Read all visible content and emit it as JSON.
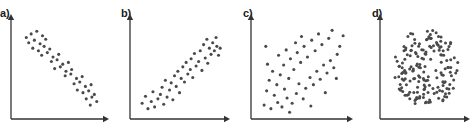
{
  "figure": {
    "background_color": "#ffffff",
    "dot_color": "#4a4a4a",
    "axis_color": "#333333",
    "label_color": "#1a1a1a",
    "width": 471,
    "height": 137
  },
  "panels": [
    {
      "label": "a)",
      "label_x": 0,
      "label_y": 8,
      "origin_x": 11,
      "origin_y": 6,
      "axis_x_start": 11,
      "axis_x_end": 109,
      "axis_y_bottom": 119,
      "axis_y_top": 19,
      "description": "strong negative correlation"
    },
    {
      "label": "b)",
      "label_x": 121,
      "label_y": 8,
      "origin_x": 130,
      "origin_y": 6,
      "axis_x_start": 130,
      "axis_x_end": 230,
      "axis_y_bottom": 119,
      "axis_y_top": 19,
      "description": "strong positive correlation"
    },
    {
      "label": "c)",
      "label_x": 243,
      "label_y": 8,
      "origin_x": 251,
      "origin_y": 6,
      "axis_x_start": 251,
      "axis_x_end": 353,
      "axis_y_bottom": 119,
      "axis_y_top": 19,
      "description": "weak positive correlation"
    },
    {
      "label": "d)",
      "label_x": 372,
      "label_y": 8,
      "origin_x": 380,
      "origin_y": 6,
      "axis_x_start": 380,
      "axis_x_end": 470,
      "axis_y_bottom": 119,
      "axis_y_top": 19,
      "description": "no correlation, circular cloud"
    }
  ],
  "chart_data": [
    {
      "type": "scatter",
      "title": "a)",
      "xlabel": "",
      "ylabel": "",
      "xlim": [
        0,
        100
      ],
      "ylim": [
        0,
        100
      ],
      "grid": false,
      "legend": "none",
      "annotation": "strong negative correlation",
      "points": [
        [
          9,
          86
        ],
        [
          15,
          90
        ],
        [
          22,
          93
        ],
        [
          29,
          88
        ],
        [
          12,
          80
        ],
        [
          19,
          83
        ],
        [
          26,
          79
        ],
        [
          33,
          84
        ],
        [
          17,
          74
        ],
        [
          24,
          71
        ],
        [
          31,
          76
        ],
        [
          38,
          73
        ],
        [
          28,
          66
        ],
        [
          35,
          69
        ],
        [
          42,
          64
        ],
        [
          49,
          67
        ],
        [
          40,
          59
        ],
        [
          47,
          61
        ],
        [
          54,
          56
        ],
        [
          61,
          58
        ],
        [
          44,
          51
        ],
        [
          51,
          53
        ],
        [
          58,
          48
        ],
        [
          65,
          50
        ],
        [
          57,
          43
        ],
        [
          64,
          45
        ],
        [
          71,
          40
        ],
        [
          78,
          42
        ],
        [
          68,
          34
        ],
        [
          75,
          36
        ],
        [
          82,
          31
        ],
        [
          89,
          33
        ],
        [
          72,
          27
        ],
        [
          79,
          24
        ],
        [
          86,
          26
        ],
        [
          93,
          22
        ],
        [
          83,
          17
        ],
        [
          90,
          19
        ],
        [
          96,
          14
        ],
        [
          88,
          10
        ]
      ]
    },
    {
      "type": "scatter",
      "title": "b)",
      "xlabel": "",
      "ylabel": "",
      "xlim": [
        0,
        100
      ],
      "ylim": [
        0,
        100
      ],
      "grid": false,
      "legend": "none",
      "annotation": "strong positive correlation",
      "points": [
        [
          5,
          12
        ],
        [
          12,
          6
        ],
        [
          9,
          20
        ],
        [
          16,
          14
        ],
        [
          20,
          8
        ],
        [
          24,
          17
        ],
        [
          18,
          25
        ],
        [
          27,
          22
        ],
        [
          31,
          11
        ],
        [
          35,
          19
        ],
        [
          29,
          30
        ],
        [
          38,
          27
        ],
        [
          42,
          16
        ],
        [
          33,
          38
        ],
        [
          40,
          35
        ],
        [
          46,
          31
        ],
        [
          50,
          24
        ],
        [
          44,
          43
        ],
        [
          52,
          40
        ],
        [
          48,
          48
        ],
        [
          56,
          36
        ],
        [
          60,
          45
        ],
        [
          54,
          53
        ],
        [
          63,
          50
        ],
        [
          58,
          58
        ],
        [
          66,
          41
        ],
        [
          70,
          54
        ],
        [
          64,
          62
        ],
        [
          73,
          59
        ],
        [
          68,
          68
        ],
        [
          77,
          49
        ],
        [
          81,
          63
        ],
        [
          75,
          71
        ],
        [
          84,
          57
        ],
        [
          88,
          67
        ],
        [
          79,
          78
        ],
        [
          86,
          74
        ],
        [
          92,
          71
        ],
        [
          90,
          80
        ],
        [
          95,
          76
        ],
        [
          83,
          84
        ],
        [
          97,
          66
        ],
        [
          94,
          86
        ],
        [
          99,
          74
        ]
      ]
    },
    {
      "type": "scatter",
      "title": "c)",
      "xlabel": "",
      "ylabel": "",
      "xlim": [
        0,
        100
      ],
      "ylim": [
        0,
        100
      ],
      "grid": false,
      "legend": "none",
      "annotation": "weak positive correlation",
      "points": [
        [
          6,
          10
        ],
        [
          14,
          6
        ],
        [
          22,
          13
        ],
        [
          9,
          26
        ],
        [
          18,
          21
        ],
        [
          27,
          8
        ],
        [
          33,
          18
        ],
        [
          12,
          38
        ],
        [
          21,
          33
        ],
        [
          30,
          28
        ],
        [
          39,
          12
        ],
        [
          44,
          23
        ],
        [
          16,
          48
        ],
        [
          25,
          44
        ],
        [
          35,
          40
        ],
        [
          47,
          34
        ],
        [
          52,
          17
        ],
        [
          10,
          56
        ],
        [
          29,
          55
        ],
        [
          41,
          50
        ],
        [
          55,
          29
        ],
        [
          60,
          41
        ],
        [
          23,
          66
        ],
        [
          37,
          62
        ],
        [
          49,
          58
        ],
        [
          64,
          33
        ],
        [
          68,
          48
        ],
        [
          32,
          72
        ],
        [
          45,
          69
        ],
        [
          57,
          64
        ],
        [
          72,
          39
        ],
        [
          76,
          55
        ],
        [
          43,
          80
        ],
        [
          53,
          76
        ],
        [
          66,
          71
        ],
        [
          80,
          46
        ],
        [
          84,
          60
        ],
        [
          50,
          87
        ],
        [
          62,
          83
        ],
        [
          74,
          78
        ],
        [
          88,
          52
        ],
        [
          92,
          67
        ],
        [
          70,
          90
        ],
        [
          82,
          85
        ],
        [
          95,
          76
        ],
        [
          99,
          88
        ],
        [
          86,
          94
        ],
        [
          91,
          40
        ],
        [
          78,
          24
        ],
        [
          61,
          9
        ],
        [
          36,
          2
        ],
        [
          8,
          76
        ]
      ]
    },
    {
      "type": "scatter",
      "title": "d)",
      "xlabel": "",
      "ylabel": "",
      "xlim": [
        0,
        100
      ],
      "ylim": [
        0,
        100
      ],
      "grid": false,
      "legend": "none",
      "annotation": "no correlation, dense circular cloud",
      "cloud": {
        "center_x": 52,
        "center_y": 52,
        "radius": 45,
        "count": 175,
        "seed": 20250411
      }
    }
  ]
}
